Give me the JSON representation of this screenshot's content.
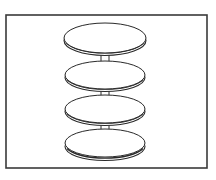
{
  "image": {
    "subject": "four-tier round stacking stand line drawing",
    "tier_count": 4,
    "colors": {
      "background": "#ffffff",
      "frame": "#3a3a3a",
      "stroke": "#2a2a2a",
      "fill": "#ffffff"
    },
    "frame": {
      "x": 6,
      "y": 15,
      "width": 201,
      "height": 153
    },
    "tiers": [
      {
        "cx": 105,
        "cy": 38,
        "rx": 41,
        "ry": 15,
        "edge": 2.5
      },
      {
        "cx": 105,
        "cy": 75,
        "rx": 40,
        "ry": 14,
        "edge": 2.5
      },
      {
        "cx": 105,
        "cy": 109,
        "rx": 40,
        "ry": 14,
        "edge": 2.5
      },
      {
        "cx": 105,
        "cy": 143,
        "rx": 40,
        "ry": 14,
        "edge": 3.5
      }
    ],
    "stems": [
      {
        "top": 54,
        "bottom": 73
      },
      {
        "top": 89,
        "bottom": 107
      },
      {
        "top": 123,
        "bottom": 141
      }
    ]
  }
}
